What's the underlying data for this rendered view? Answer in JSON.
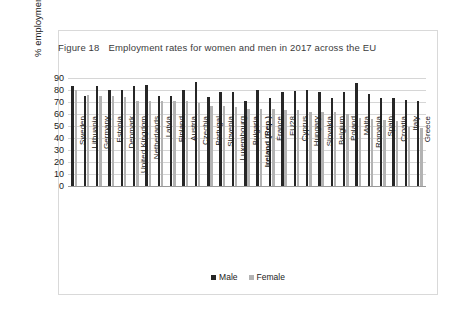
{
  "figure": {
    "number": "Figure 18",
    "title": "Employment rates for women and men in 2017 across the EU"
  },
  "legend": {
    "male_label": "Male",
    "female_label": "Female",
    "male_color": "#262626",
    "female_color": "#b3b3b3",
    "position": "bottom-center"
  },
  "chart_data": {
    "type": "bar",
    "xlabel": "",
    "ylabel": "% employment rate",
    "ylim": [
      0,
      90
    ],
    "yticks": [
      0,
      10,
      20,
      30,
      40,
      50,
      60,
      70,
      80,
      90
    ],
    "grid": true,
    "highlight_category": "Ireland (Rep.)",
    "categories": [
      "Sweden",
      "Lithuania",
      "Germany",
      "Estonia",
      "Denmark",
      "United Kingdom",
      "Netherlands",
      "Latvia",
      "Finland",
      "Austria",
      "Czechia",
      "Portugal",
      "Slovenia",
      "Luxembourg",
      "Bulgaria",
      "Ireland (Rep.)",
      "France",
      "EU28",
      "Cyprus",
      "Hungary",
      "Slovakia",
      "Belgium",
      "Poland",
      "Malta",
      "Romania",
      "Spain",
      "Croatia",
      "Italy",
      "Greece"
    ],
    "series": [
      {
        "name": "Male",
        "color": "#262626",
        "values": [
          83,
          75,
          83,
          80,
          80,
          83,
          84,
          75,
          75,
          80,
          87,
          74,
          78,
          78,
          71,
          80,
          73,
          78,
          79,
          80,
          78,
          73,
          78,
          86,
          77,
          73,
          73,
          72,
          71
        ]
      },
      {
        "name": "Female",
        "color": "#b3b3b3",
        "values": [
          80,
          76,
          75,
          75,
          74,
          71,
          71,
          71,
          71,
          71,
          69,
          67,
          67,
          66,
          64,
          64,
          64,
          63,
          63,
          62,
          62,
          62,
          60,
          57,
          56,
          55,
          54,
          49,
          48
        ]
      }
    ]
  }
}
